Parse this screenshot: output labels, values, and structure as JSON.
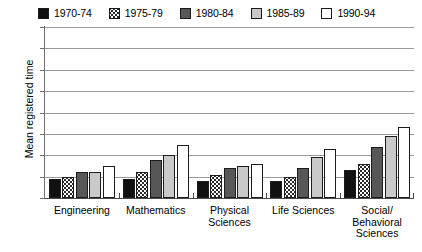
{
  "chart_data": {
    "type": "bar",
    "title": "",
    "subtitle": "",
    "xlabel": "",
    "ylabel": "Mean registered time",
    "ylim": [
      5,
      13
    ],
    "yticks": [
      5,
      6,
      7,
      8,
      9,
      10,
      11,
      12,
      13
    ],
    "grid": true,
    "legend_position": "top",
    "categories": [
      "Engineering",
      "Mathematics",
      "Physical\nSciences",
      "Life Sciences",
      "Social/\nBehavioral\nSciences"
    ],
    "series": [
      {
        "name": "1970-74",
        "color": "#111111",
        "pattern": "solid-black",
        "values": [
          5.9,
          5.9,
          5.8,
          5.8,
          6.3
        ]
      },
      {
        "name": "1975-79",
        "color": "#ffffff",
        "pattern": "dotted",
        "values": [
          6.0,
          6.2,
          6.1,
          6.0,
          6.6
        ]
      },
      {
        "name": "1980-84",
        "color": "#575757",
        "pattern": "solid-dkgray",
        "values": [
          6.2,
          6.8,
          6.4,
          6.4,
          7.4
        ]
      },
      {
        "name": "1985-89",
        "color": "#c9c9c9",
        "pattern": "solid-ltgray",
        "values": [
          6.2,
          7.0,
          6.5,
          6.9,
          7.9
        ]
      },
      {
        "name": "1990-94",
        "color": "#ffffff",
        "pattern": "solid-white",
        "values": [
          6.5,
          7.5,
          6.6,
          7.3,
          8.3
        ]
      }
    ]
  },
  "legend": {
    "items": [
      {
        "label": "1970-74"
      },
      {
        "label": "1975-79"
      },
      {
        "label": "1980-84"
      },
      {
        "label": "1985-89"
      },
      {
        "label": "1990-94"
      }
    ]
  },
  "axes": {
    "y_title": "Mean registered time",
    "y_tick_labels": [
      "13",
      "12",
      "11",
      "10",
      "9",
      "8",
      "7",
      "6",
      "5"
    ],
    "x_tick_labels": [
      "Engineering",
      "Mathematics",
      "Physical Sciences",
      "Life Sciences",
      "Social/ Behavioral Sciences"
    ],
    "x_tick_lines": [
      [
        "Engineering"
      ],
      [
        "Mathematics"
      ],
      [
        "Physical",
        "Sciences"
      ],
      [
        "Life Sciences"
      ],
      [
        "Social/",
        "Behavioral",
        "Sciences"
      ]
    ]
  }
}
